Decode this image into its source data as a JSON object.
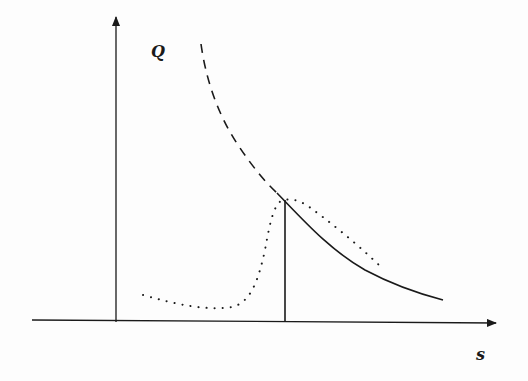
{
  "diagram": {
    "axes": {
      "y_label": "Q",
      "x_label": "s"
    },
    "curves": [
      {
        "name": "dashed-curve",
        "style": "dashed",
        "description": "decreasing branch above the critical point"
      },
      {
        "name": "solid-curve",
        "style": "solid",
        "description": "decreasing branch after the vertical line"
      },
      {
        "name": "dotted-curve",
        "style": "dotted",
        "description": "low plateau, sharp rise to peak, then decay"
      }
    ],
    "markers": [
      {
        "name": "vertical-line",
        "style": "solid"
      }
    ],
    "colors": {
      "ink": "#1a1a1a",
      "background": "#fdfdfd"
    }
  }
}
